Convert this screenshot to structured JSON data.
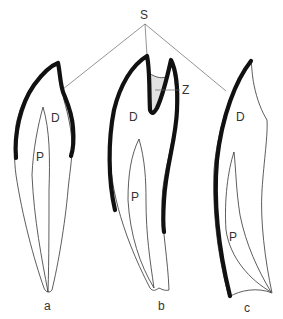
{
  "figure": {
    "labels": {
      "apex": "S",
      "zone": "Z",
      "dentin": "D",
      "pulp": "P"
    },
    "teeth": [
      {
        "id": "a",
        "caption": "a",
        "dentin_label": "D",
        "pulp_label": "P"
      },
      {
        "id": "b",
        "caption": "b",
        "dentin_label": "D",
        "pulp_label": "P",
        "zone_label": "Z"
      },
      {
        "id": "c",
        "caption": "c",
        "dentin_label": "D",
        "pulp_label": "P"
      }
    ],
    "colors": {
      "enamel": "#111111",
      "outline": "#333333",
      "leader": "#666666",
      "zone_fill": "#dddddd",
      "background": "#ffffff"
    }
  }
}
